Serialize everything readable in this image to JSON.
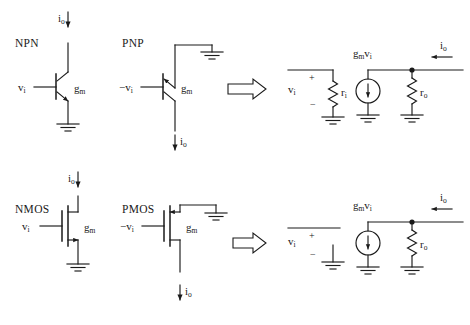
{
  "figure": {
    "background_color": "#ffffff",
    "ink_color": "#1a1a1a"
  },
  "labels": {
    "npn": "NPN",
    "pnp": "PNP",
    "nmos": "NMOS",
    "pmos": "PMOS",
    "vi": "v",
    "vi_sub": "i",
    "neg_vi": "−v",
    "neg_vi_sub": "i",
    "gm": "g",
    "gm_sub": "m",
    "io": "i",
    "io_sub": "o",
    "ri": "r",
    "ri_sub": "i",
    "ro": "r",
    "ro_sub": "o",
    "gmvi": "g",
    "gmvi_sub1": "m",
    "gmvi_mid": "v",
    "gmvi_sub2": "i",
    "plus": "+",
    "minus": "−"
  },
  "rows": [
    {
      "name": "bjt-row",
      "devices": [
        {
          "kind": "npn-transistor",
          "label": "NPN",
          "terminal_top": "collector",
          "terminal_bottom": "emitter",
          "base_label": "v_i",
          "gain_label": "g_m",
          "current_label": "i_o",
          "current_direction": "down-into-collector",
          "ground_at": "bottom"
        },
        {
          "kind": "pnp-transistor",
          "label": "PNP",
          "terminal_top": "emitter",
          "terminal_bottom": "collector",
          "base_label": "-v_i",
          "gain_label": "g_m",
          "current_label": "i_o",
          "current_direction": "down-out-of-collector",
          "ground_at": "top-right"
        }
      ],
      "implies_arrow": "⇒",
      "equivalent": {
        "input_port": {
          "voltage_label": "v_i",
          "polarity_top": "+",
          "polarity_bottom": "−",
          "element": "r_i",
          "element_type": "resistor",
          "ground": true
        },
        "output_port": {
          "source_label": "g_m v_i",
          "source_type": "current-source",
          "source_direction": "down",
          "element": "r_o",
          "element_type": "resistor",
          "current_label": "i_o",
          "current_direction": "left-into-node",
          "junction_dot": true,
          "ground": true
        }
      }
    },
    {
      "name": "mos-row",
      "devices": [
        {
          "kind": "nmos-transistor",
          "label": "NMOS",
          "terminal_top": "drain",
          "terminal_bottom": "source",
          "base_label": "v_i",
          "gain_label": "g_m",
          "current_label": "i_o",
          "current_direction": "down-into-drain",
          "ground_at": "bottom"
        },
        {
          "kind": "pmos-transistor",
          "label": "PMOS",
          "terminal_top": "source",
          "terminal_bottom": "drain",
          "base_label": "-v_i",
          "gain_label": "g_m",
          "current_label": "i_o",
          "current_direction": "down-out-of-drain",
          "ground_at": "top-right"
        }
      ],
      "implies_arrow": "⇒",
      "equivalent": {
        "input_port": {
          "voltage_label": "v_i",
          "polarity_top": "+",
          "polarity_bottom": "−",
          "element": "open-circuit",
          "element_type": "none",
          "ground": true
        },
        "output_port": {
          "source_label": "g_m v_i",
          "source_type": "current-source",
          "source_direction": "down",
          "element": "r_o",
          "element_type": "resistor",
          "current_label": "i_o",
          "current_direction": "left-into-node",
          "junction_dot": true,
          "ground": true
        }
      }
    }
  ]
}
